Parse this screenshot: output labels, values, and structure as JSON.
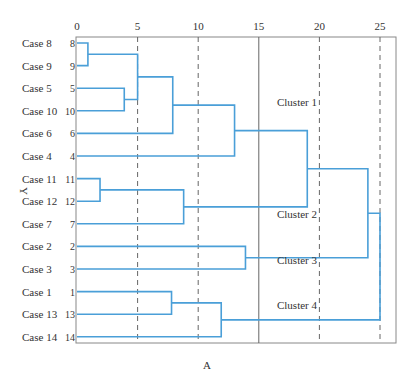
{
  "chart_data": {
    "type": "dendrogram",
    "title": "",
    "caption": "A",
    "ylabel": "Y",
    "xlabel": "",
    "x_ticks": [
      0,
      5,
      10,
      15,
      20,
      25
    ],
    "xlim": [
      0,
      26.5
    ],
    "grid": {
      "dashed_at": [
        5,
        10,
        20,
        25
      ],
      "solid_cut_line_at": 15
    },
    "leaves": [
      {
        "label": "Case 8",
        "num": "8"
      },
      {
        "label": "Case 9",
        "num": "9"
      },
      {
        "label": "Case 5",
        "num": "5"
      },
      {
        "label": "Case 10",
        "num": "10"
      },
      {
        "label": "Case 6",
        "num": "6"
      },
      {
        "label": "Case 4",
        "num": "4"
      },
      {
        "label": "Case 11",
        "num": "11"
      },
      {
        "label": "Case 12",
        "num": "12"
      },
      {
        "label": "Case 7",
        "num": "7"
      },
      {
        "label": "Case 2",
        "num": "2"
      },
      {
        "label": "Case 3",
        "num": "3"
      },
      {
        "label": "Case 1",
        "num": "1"
      },
      {
        "label": "Case 13",
        "num": "13"
      },
      {
        "label": "Case 14",
        "num": "14"
      }
    ],
    "merges": [
      {
        "id": "m1",
        "left": "Case 8",
        "right": "Case 9",
        "height": 0.9
      },
      {
        "id": "m2",
        "left": "Case 5",
        "right": "Case 10",
        "height": 3.9
      },
      {
        "id": "m3",
        "left": "m1",
        "right": "m2",
        "height": 5.0
      },
      {
        "id": "m4",
        "left": "m3",
        "right": "Case 6",
        "height": 7.9
      },
      {
        "id": "m5",
        "left": "m4",
        "right": "Case 4",
        "height": 13.0
      },
      {
        "id": "m6",
        "left": "Case 11",
        "right": "Case 12",
        "height": 1.9
      },
      {
        "id": "m7",
        "left": "m6",
        "right": "Case 7",
        "height": 8.8
      },
      {
        "id": "m8",
        "left": "Case 2",
        "right": "Case 3",
        "height": 13.9
      },
      {
        "id": "m9",
        "left": "Case 1",
        "right": "Case 13",
        "height": 7.8
      },
      {
        "id": "m10",
        "left": "m9",
        "right": "Case 14",
        "height": 11.9
      },
      {
        "id": "m11",
        "left": "m5",
        "right": "m7",
        "height": 19.0
      },
      {
        "id": "m12",
        "left": "m11",
        "right": "m8",
        "height": 24.0
      },
      {
        "id": "m13",
        "left": "m12",
        "right": "m10",
        "height": 25.0
      }
    ],
    "clusters": [
      {
        "label": "Cluster 1",
        "members": [
          "Case 8",
          "Case 9",
          "Case 5",
          "Case 10",
          "Case 6",
          "Case 4"
        ]
      },
      {
        "label": "Cluster 2",
        "members": [
          "Case 11",
          "Case 12",
          "Case 7"
        ]
      },
      {
        "label": "Cluster 3",
        "members": [
          "Case 2",
          "Case 3"
        ]
      },
      {
        "label": "Cluster 4",
        "members": [
          "Case 1",
          "Case 13",
          "Case 14"
        ]
      }
    ],
    "colors": {
      "branch": "#4a9fd8",
      "axis": "#888888",
      "grid": "#666666"
    }
  }
}
